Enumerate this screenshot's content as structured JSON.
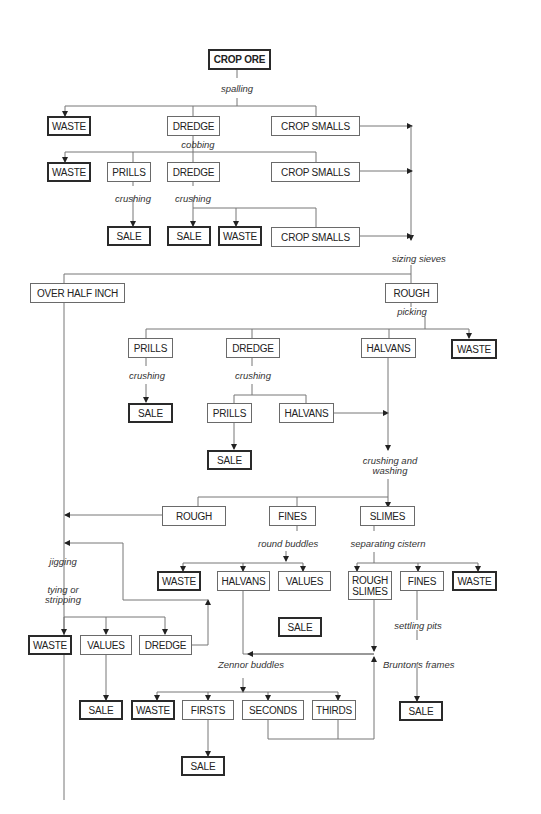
{
  "diagram": {
    "type": "process-flowchart",
    "nodes": [
      {
        "id": "n1",
        "label": "CROP ORE",
        "kind": "terminal-bold"
      },
      {
        "id": "n2",
        "label": "WASTE",
        "kind": "terminal"
      },
      {
        "id": "n3",
        "label": "DREDGE",
        "kind": "process"
      },
      {
        "id": "n4",
        "label": "CROP SMALLS",
        "kind": "process"
      },
      {
        "id": "n5",
        "label": "WASTE",
        "kind": "terminal"
      },
      {
        "id": "n6",
        "label": "PRILLS",
        "kind": "process"
      },
      {
        "id": "n7",
        "label": "DREDGE",
        "kind": "process"
      },
      {
        "id": "n8",
        "label": "CROP SMALLS",
        "kind": "process"
      },
      {
        "id": "n9",
        "label": "SALE",
        "kind": "terminal"
      },
      {
        "id": "n10",
        "label": "SALE",
        "kind": "terminal"
      },
      {
        "id": "n11",
        "label": "WASTE",
        "kind": "terminal"
      },
      {
        "id": "n12",
        "label": "CROP SMALLS",
        "kind": "process"
      },
      {
        "id": "n13",
        "label": "OVER HALF INCH",
        "kind": "process"
      },
      {
        "id": "n14",
        "label": "ROUGH",
        "kind": "process"
      },
      {
        "id": "n15",
        "label": "PRILLS",
        "kind": "process"
      },
      {
        "id": "n16",
        "label": "DREDGE",
        "kind": "process"
      },
      {
        "id": "n17",
        "label": "HALVANS",
        "kind": "process"
      },
      {
        "id": "n18",
        "label": "WASTE",
        "kind": "terminal"
      },
      {
        "id": "n19",
        "label": "SALE",
        "kind": "terminal"
      },
      {
        "id": "n20",
        "label": "PRILLS",
        "kind": "process"
      },
      {
        "id": "n21",
        "label": "HALVANS",
        "kind": "process"
      },
      {
        "id": "n22",
        "label": "SALE",
        "kind": "terminal"
      },
      {
        "id": "n23",
        "label": "ROUGH",
        "kind": "process"
      },
      {
        "id": "n24",
        "label": "FINES",
        "kind": "process"
      },
      {
        "id": "n25",
        "label": "SLIMES",
        "kind": "process"
      },
      {
        "id": "n26",
        "label": "WASTE",
        "kind": "terminal"
      },
      {
        "id": "n27",
        "label": "HALVANS",
        "kind": "process"
      },
      {
        "id": "n28",
        "label": "VALUES",
        "kind": "process"
      },
      {
        "id": "n29",
        "label": "ROUGH SLIMES",
        "kind": "process"
      },
      {
        "id": "n30",
        "label": "FINES",
        "kind": "process"
      },
      {
        "id": "n31",
        "label": "WASTE",
        "kind": "terminal"
      },
      {
        "id": "n32",
        "label": "SALE",
        "kind": "terminal"
      },
      {
        "id": "n33",
        "label": "WASTE",
        "kind": "terminal"
      },
      {
        "id": "n34",
        "label": "VALUES",
        "kind": "process"
      },
      {
        "id": "n35",
        "label": "DREDGE",
        "kind": "process"
      },
      {
        "id": "n36",
        "label": "SALE",
        "kind": "terminal"
      },
      {
        "id": "n37",
        "label": "WASTE",
        "kind": "terminal"
      },
      {
        "id": "n38",
        "label": "FIRSTS",
        "kind": "process"
      },
      {
        "id": "n39",
        "label": "SECONDS",
        "kind": "process"
      },
      {
        "id": "n40",
        "label": "THIRDS",
        "kind": "process"
      },
      {
        "id": "n41",
        "label": "SALE",
        "kind": "terminal"
      },
      {
        "id": "n42",
        "label": "SALE",
        "kind": "terminal"
      }
    ],
    "process_labels": {
      "spalling": "spalling",
      "cobbing": "cobbing",
      "crushing": "crushing",
      "sizing_sieves": "sizing sieves",
      "picking": "picking",
      "crushing_and_washing": "crushing and washing",
      "round_buddles": "round buddles",
      "separating_cistern": "separating cistern",
      "jigging": "jigging",
      "tying_or_stripping": "tying or stripping",
      "settling_pits": "settling pits",
      "bruntons_frames": "Brunton's frames",
      "zennor_buddles": "Zennor buddles"
    },
    "edges": [
      [
        "n1",
        "spalling",
        [
          "n2",
          "n3",
          "n4"
        ]
      ],
      [
        "n3",
        "cobbing",
        [
          "n5",
          "n6",
          "n7",
          "n8"
        ]
      ],
      [
        "n6",
        "crushing",
        [
          "n9"
        ]
      ],
      [
        "n7",
        "crushing",
        [
          "n10",
          "n11",
          "n12"
        ]
      ],
      [
        [
          "n4",
          "n8",
          "n12"
        ],
        "sizing sieves",
        [
          "n13",
          "n14"
        ]
      ],
      [
        "n14",
        "picking",
        [
          "n15",
          "n16",
          "n17",
          "n18"
        ]
      ],
      [
        "n15",
        "crushing",
        [
          "n19"
        ]
      ],
      [
        "n16",
        "crushing",
        [
          "n20",
          "n21"
        ]
      ],
      [
        "n20",
        "",
        [
          "n22"
        ]
      ],
      [
        [
          "n17",
          "n21"
        ],
        "crushing and washing",
        [
          "n23",
          "n24",
          "n25"
        ]
      ],
      [
        "n23",
        "",
        [
          "n13-line"
        ]
      ],
      [
        "n24",
        "round buddles",
        [
          "n26",
          "n27",
          "n28"
        ]
      ],
      [
        "n25",
        "separating cistern",
        [
          "n29",
          "n30",
          "n31"
        ]
      ],
      [
        "n13",
        "jigging / tying or stripping",
        [
          "n33",
          "n34",
          "n35"
        ]
      ],
      [
        "n35",
        "",
        [
          "jigging-loop"
        ]
      ],
      [
        "n34",
        "",
        [
          "n36"
        ]
      ],
      [
        "n30",
        "settling pits / Brunton's frames",
        [
          "n42"
        ]
      ],
      [
        [
          "n27",
          "n29"
        ],
        "Zennor buddles",
        [
          "n37",
          "n38",
          "n39",
          "n40"
        ]
      ],
      [
        "n38",
        "",
        [
          "n41"
        ]
      ],
      [
        [
          "n39",
          "n40"
        ],
        "",
        [
          "n29-return"
        ]
      ]
    ]
  },
  "labels": {
    "n1": "CROP ORE",
    "n2": "WASTE",
    "n3": "DREDGE",
    "n4": "CROP SMALLS",
    "n5": "WASTE",
    "n6": "PRILLS",
    "n7": "DREDGE",
    "n8": "CROP SMALLS",
    "n9": "SALE",
    "n10": "SALE",
    "n11": "WASTE",
    "n12": "CROP SMALLS",
    "n13": "OVER HALF INCH",
    "n14": "ROUGH",
    "n15": "PRILLS",
    "n16": "DREDGE",
    "n17": "HALVANS",
    "n18": "WASTE",
    "n19": "SALE",
    "n20": "PRILLS",
    "n21": "HALVANS",
    "n22": "SALE",
    "n23": "ROUGH",
    "n24": "FINES",
    "n25": "SLIMES",
    "n26": "WASTE",
    "n27": "HALVANS",
    "n28": "VALUES",
    "n29": "ROUGH SLIMES",
    "n30": "FINES",
    "n31": "WASTE",
    "n32": "SALE",
    "n33": "WASTE",
    "n34": "VALUES",
    "n35": "DREDGE",
    "n36": "SALE",
    "n37": "WASTE",
    "n38": "FIRSTS",
    "n39": "SECONDS",
    "n40": "THIRDS",
    "n41": "SALE",
    "n42": "SALE",
    "t_spalling": "spalling",
    "t_cobbing": "cobbing",
    "t_crushing1": "crushing",
    "t_crushing2": "crushing",
    "t_sizing": "sizing sieves",
    "t_picking": "picking",
    "t_crushing3": "crushing",
    "t_crushing4": "crushing",
    "t_crushwash1": "crushing and",
    "t_crushwash2": "washing",
    "t_round": "round buddles",
    "t_cistern": "separating cistern",
    "t_jigging": "jigging",
    "t_tying1": "tying or",
    "t_tying2": "stripping",
    "t_settling": "settling pits",
    "t_brunton": "Brunton's frames",
    "t_zennor": "Zennor buddles"
  }
}
